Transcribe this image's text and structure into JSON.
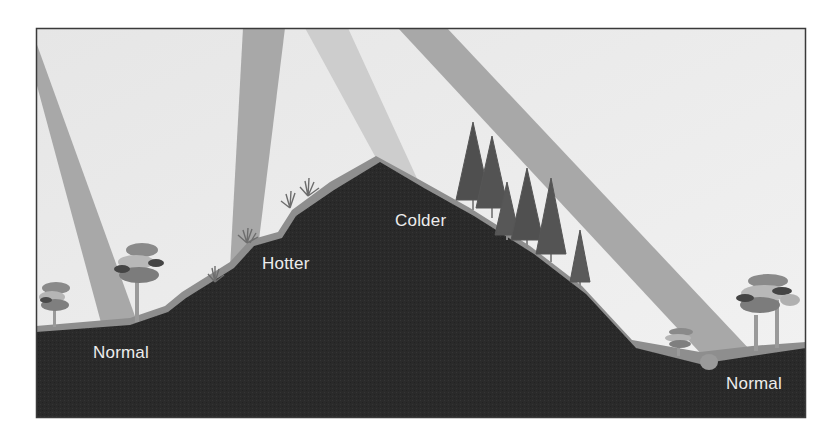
{
  "diagram": {
    "labels": {
      "normal_left": "Normal",
      "hotter": "Hotter",
      "colder": "Colder",
      "normal_right": "Normal"
    },
    "elements": {
      "sun_rays": 4,
      "regions": [
        "Normal (left lowland)",
        "Hotter (sun-facing slope)",
        "Colder (shaded slope)",
        "Normal (right valley)"
      ],
      "vegetation": [
        "deciduous trees (left)",
        "shrubs (hotter slope)",
        "conifer trees (colder slope)",
        "deciduous trees (right)"
      ]
    },
    "colors": {
      "sky": "#ebebeb",
      "ray": "#a9a9a9",
      "ground": "#2b2b2b",
      "surface": "#8f8f8f",
      "frame": "#3a3a3a",
      "label": "#ededed"
    }
  }
}
